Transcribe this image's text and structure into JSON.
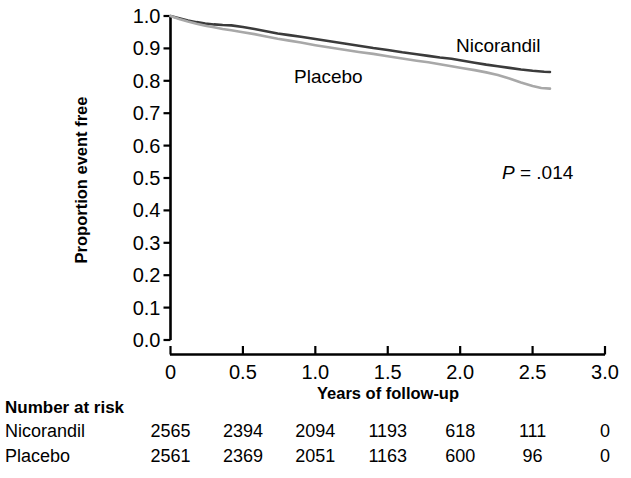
{
  "chart_data": {
    "type": "line",
    "title": "",
    "xlabel": "Years of follow-up",
    "ylabel": "Proportion event free",
    "xlim": [
      0,
      3.0
    ],
    "ylim": [
      0.0,
      1.0
    ],
    "xticks": [
      "0",
      "0.5",
      "1.0",
      "1.5",
      "2.0",
      "2.5",
      "3.0"
    ],
    "xtick_values": [
      0,
      0.5,
      1.0,
      1.5,
      2.0,
      2.5,
      3.0
    ],
    "yticks": [
      "0.0",
      "0.1",
      "0.2",
      "0.3",
      "0.4",
      "0.5",
      "0.6",
      "0.7",
      "0.8",
      "0.9",
      "1.0"
    ],
    "ytick_values": [
      0.0,
      0.1,
      0.2,
      0.3,
      0.4,
      0.5,
      0.6,
      0.7,
      0.8,
      0.9,
      1.0
    ],
    "grid": false,
    "legend_position": "inline-labels",
    "annotations": [
      {
        "name": "p-value",
        "text": "P = .014",
        "italic_prefix": "P",
        "rest": " = .014",
        "x": 2.38,
        "y": 0.545
      }
    ],
    "series": [
      {
        "name": "Nicorandil",
        "color": "#3b3b3b",
        "label_x": 2.2,
        "label_y": 0.935,
        "x": [
          0.0,
          0.06,
          0.12,
          0.18,
          0.24,
          0.3,
          0.36,
          0.42,
          0.5,
          0.58,
          0.66,
          0.74,
          0.82,
          0.9,
          1.0,
          1.1,
          1.2,
          1.3,
          1.4,
          1.5,
          1.6,
          1.7,
          1.78,
          1.86,
          1.94,
          2.02,
          2.1,
          2.18,
          2.26,
          2.34,
          2.42,
          2.5,
          2.58,
          2.62
        ],
        "y": [
          1.0,
          0.993,
          0.986,
          0.981,
          0.977,
          0.974,
          0.972,
          0.971,
          0.966,
          0.96,
          0.953,
          0.946,
          0.941,
          0.936,
          0.929,
          0.922,
          0.915,
          0.908,
          0.901,
          0.895,
          0.888,
          0.882,
          0.877,
          0.872,
          0.868,
          0.862,
          0.856,
          0.85,
          0.845,
          0.84,
          0.835,
          0.831,
          0.828,
          0.827
        ]
      },
      {
        "name": "Placebo",
        "color": "#a8a8a8",
        "label_x": 1.06,
        "label_y": 0.83,
        "x": [
          0.0,
          0.06,
          0.12,
          0.18,
          0.24,
          0.3,
          0.36,
          0.42,
          0.5,
          0.58,
          0.66,
          0.74,
          0.82,
          0.9,
          1.0,
          1.1,
          1.2,
          1.3,
          1.4,
          1.5,
          1.6,
          1.7,
          1.78,
          1.86,
          1.94,
          2.02,
          2.1,
          2.18,
          2.26,
          2.34,
          2.42,
          2.5,
          2.56,
          2.62
        ],
        "y": [
          1.0,
          0.991,
          0.983,
          0.976,
          0.97,
          0.965,
          0.96,
          0.956,
          0.95,
          0.944,
          0.937,
          0.93,
          0.924,
          0.918,
          0.91,
          0.903,
          0.896,
          0.889,
          0.883,
          0.876,
          0.869,
          0.862,
          0.857,
          0.851,
          0.845,
          0.839,
          0.833,
          0.826,
          0.818,
          0.807,
          0.795,
          0.784,
          0.778,
          0.776
        ]
      }
    ]
  },
  "risk_table": {
    "title": "Number at risk",
    "col_positions": [
      0,
      0.5,
      1.0,
      1.5,
      2.0,
      2.5,
      3.0
    ],
    "rows": [
      {
        "name": "Nicorandil",
        "values": [
          "2565",
          "2394",
          "2094",
          "1193",
          "618",
          "111",
          "0"
        ]
      },
      {
        "name": "Placebo",
        "values": [
          "2561",
          "2369",
          "2051",
          "1163",
          "600",
          "96",
          "0"
        ]
      }
    ]
  }
}
